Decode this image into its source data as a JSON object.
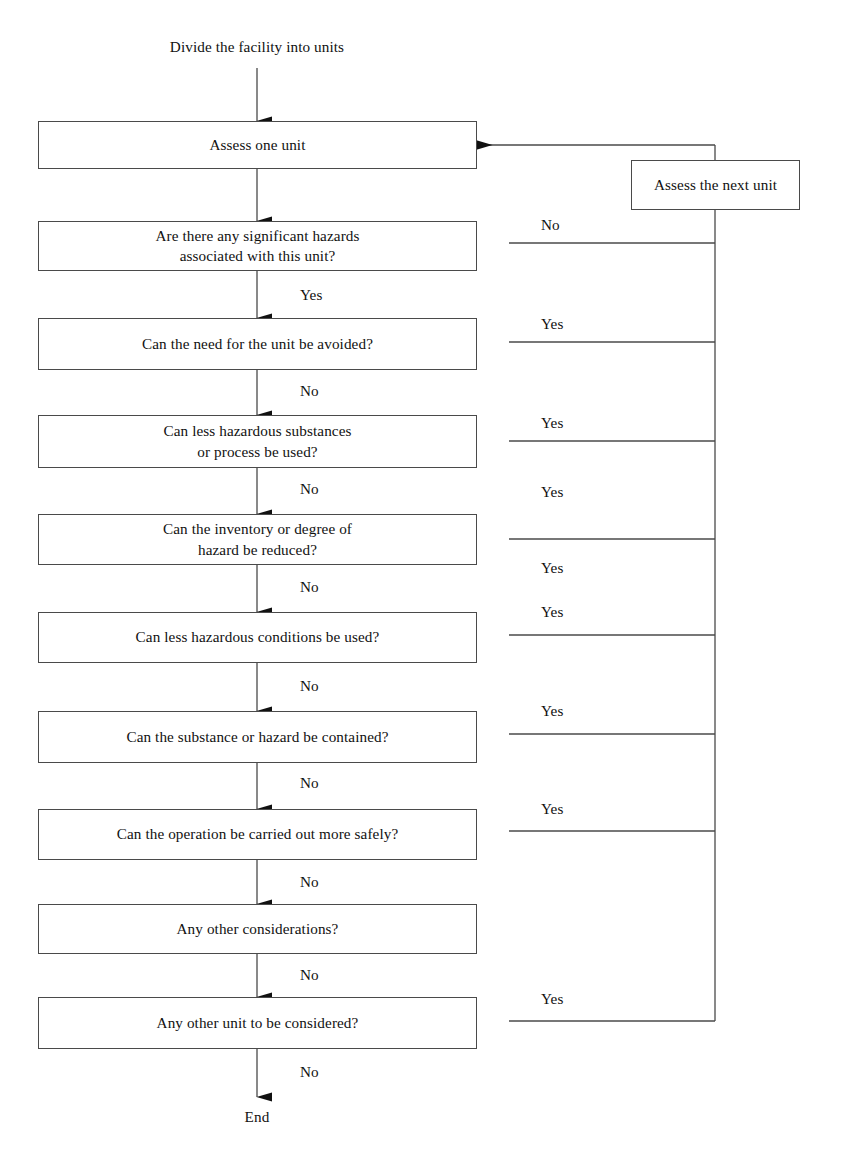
{
  "diagram": {
    "title_text": "Divide the facility into units",
    "end_text": "End",
    "nodes": [
      {
        "id": "assess-one-unit",
        "text": "Assess one unit"
      },
      {
        "id": "significant-hazards",
        "text": "Are there any significant hazards\nassociated with this unit?"
      },
      {
        "id": "need-avoided",
        "text": "Can the need for the unit be avoided?"
      },
      {
        "id": "less-hazardous-substances",
        "text": "Can less hazardous substances\nor process be used?"
      },
      {
        "id": "inventory-degree",
        "text": "Can the inventory or degree of\nhazard be reduced?"
      },
      {
        "id": "less-hazardous-conditions",
        "text": "Can less hazardous conditions be used?"
      },
      {
        "id": "substance-contained",
        "text": "Can the substance or hazard be contained?"
      },
      {
        "id": "operation-safely",
        "text": "Can the operation be carried out more safely?"
      },
      {
        "id": "other-considerations",
        "text": "Any other considerations?"
      },
      {
        "id": "other-unit",
        "text": "Any other unit to be considered?"
      }
    ],
    "recycle_node": {
      "id": "assess-next-unit",
      "text": "Assess the next unit"
    },
    "vertical_labels": [
      {
        "id": "yes-after-hazards",
        "text": "Yes"
      },
      {
        "id": "no-after-need-avoided",
        "text": "No"
      },
      {
        "id": "no-after-substances",
        "text": "No"
      },
      {
        "id": "no-after-inventory",
        "text": "No"
      },
      {
        "id": "no-after-conditions",
        "text": "No"
      },
      {
        "id": "no-after-contained",
        "text": "No"
      },
      {
        "id": "no-after-safely",
        "text": "No"
      },
      {
        "id": "no-after-considerations",
        "text": "No"
      },
      {
        "id": "no-after-other-unit",
        "text": "No"
      }
    ],
    "branch_labels": [
      {
        "id": "branch-hazards",
        "text": "No"
      },
      {
        "id": "branch-need-avoided",
        "text": "Yes"
      },
      {
        "id": "branch-substances",
        "text": "Yes"
      },
      {
        "id": "branch-inventory",
        "text": "Yes"
      },
      {
        "id": "branch-conditions-upper",
        "text": "Yes"
      },
      {
        "id": "branch-conditions-lower",
        "text": "Yes"
      },
      {
        "id": "branch-contained",
        "text": "Yes"
      },
      {
        "id": "branch-safely",
        "text": "Yes"
      },
      {
        "id": "branch-other-unit",
        "text": "Yes"
      }
    ],
    "colors": {
      "line": "#4a4a4a",
      "arrow": "#111111",
      "text": "#111111",
      "background": "#ffffff"
    }
  }
}
